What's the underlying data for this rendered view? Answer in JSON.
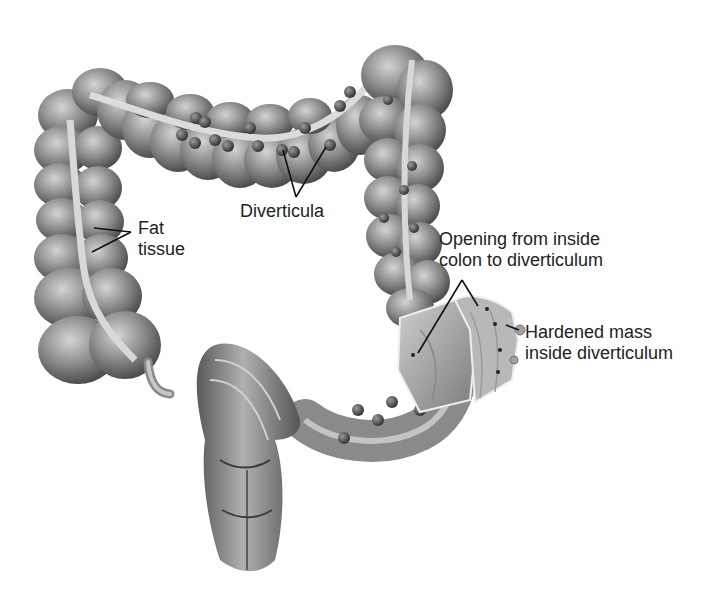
{
  "figure": {
    "colors": {
      "background": "#ffffff",
      "tissue_dark": "#4a4a4a",
      "tissue_mid": "#8a8a8a",
      "tissue_light": "#c8c8c8",
      "fat_strip": "#d9d9d9",
      "diverticula": "#3c3c3c",
      "leader_line": "#111111",
      "label_text": "#222222"
    },
    "labels": [
      {
        "id": "fat-tissue",
        "lines": [
          "Fat",
          "tissue"
        ]
      },
      {
        "id": "diverticula",
        "lines": [
          "Diverticula"
        ]
      },
      {
        "id": "opening",
        "lines": [
          "Opening from inside",
          "colon to diverticulum"
        ]
      },
      {
        "id": "hardened-mass",
        "lines": [
          "Hardened mass",
          "inside diverticulum"
        ]
      }
    ]
  }
}
